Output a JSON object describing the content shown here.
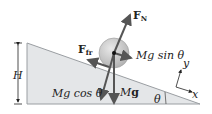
{
  "diagram": {
    "labels": {
      "height": "H",
      "normal_force": "F",
      "normal_force_sub": "N",
      "friction": "F",
      "friction_sub": "fr",
      "mg_sin": "Mg sin θ",
      "mg_cos": "Mg cos θ",
      "weight_prefix": "M",
      "weight_vec": "g",
      "angle": "θ",
      "axis_x": "x",
      "axis_y": "y"
    },
    "colors": {
      "incline_fill": "#e4e6e8",
      "incline_stroke": "#9a9ea2",
      "ball_fill": "#c9c9c9",
      "arrow": "#555555",
      "text": "#222222"
    }
  }
}
